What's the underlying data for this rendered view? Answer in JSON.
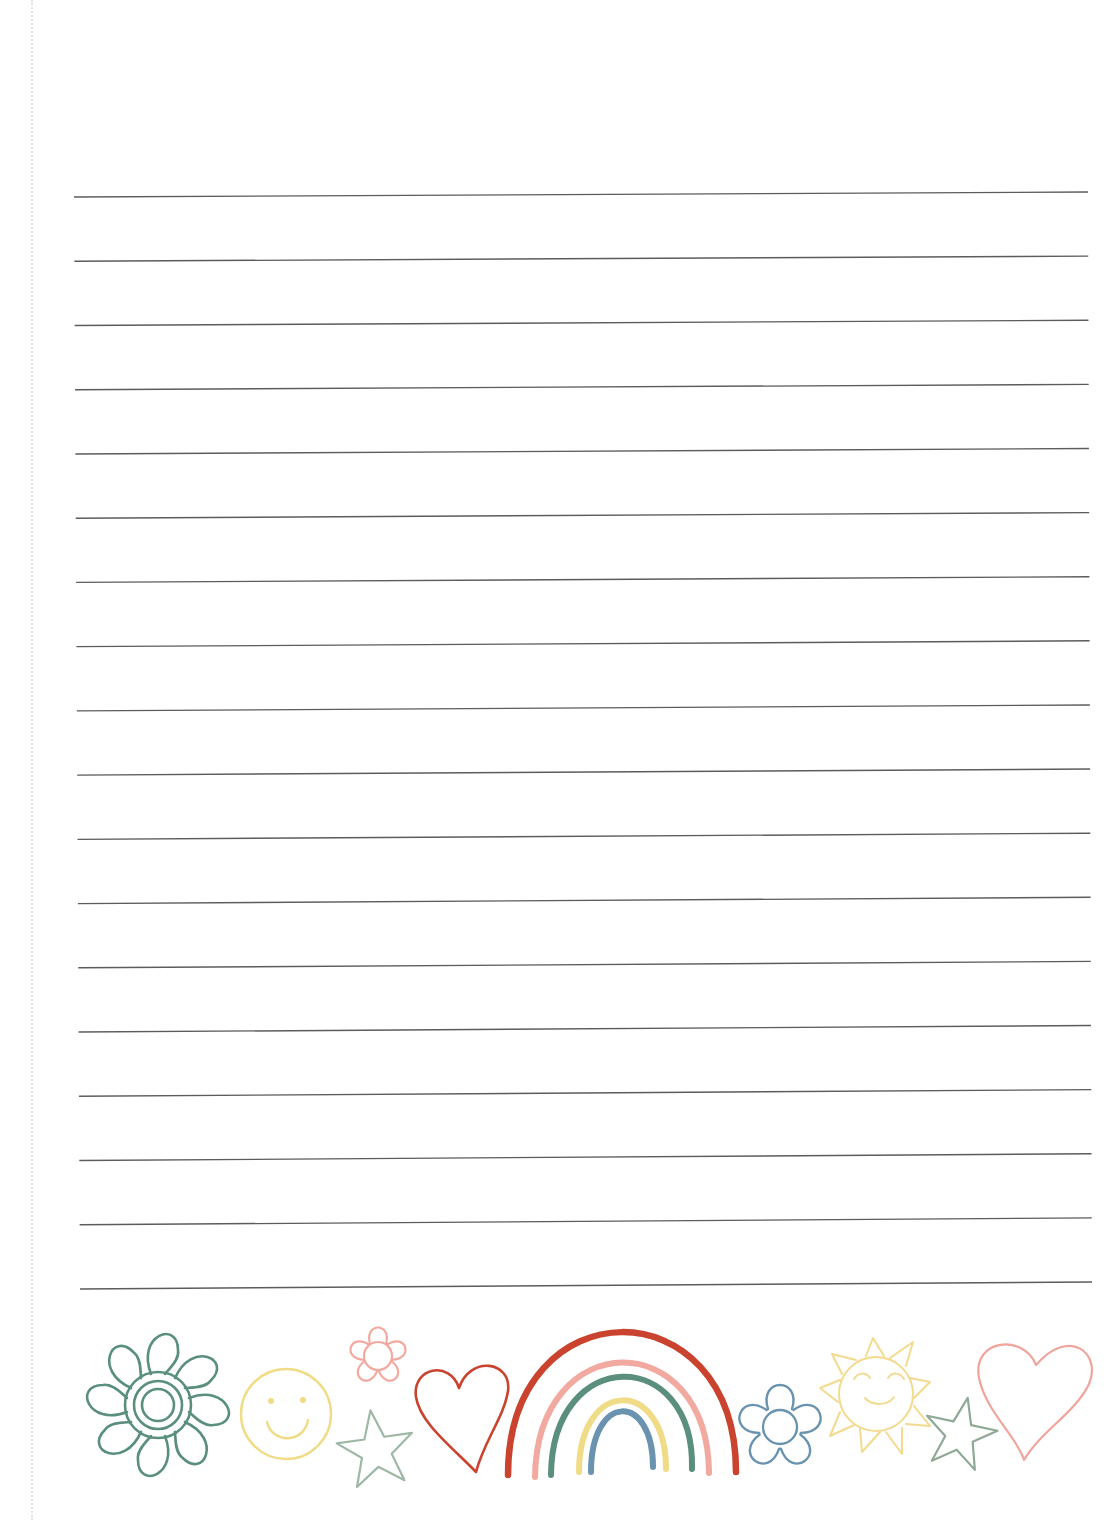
{
  "page": {
    "type": "lined-writing-paper",
    "line_count": 18,
    "line_color": "#5c5c5c",
    "first_line": {
      "x1": 74,
      "y1": 197,
      "x2": 1088,
      "y2": 192
    },
    "last_line": {
      "x1": 80,
      "y1": 1289,
      "x2": 1092,
      "y2": 1282
    }
  },
  "decorations": [
    {
      "icon": "flower-icon",
      "color": "#5a8f7e"
    },
    {
      "icon": "smiley-face-icon",
      "color": "#f0dc86"
    },
    {
      "icon": "small-flower-icon",
      "color": "#f2a9a0"
    },
    {
      "icon": "star-icon",
      "color": "#9fb8a6"
    },
    {
      "icon": "heart-icon",
      "color": "#c9432e"
    },
    {
      "icon": "rainbow-icon",
      "colors": [
        "#c9432e",
        "#f2a9a0",
        "#5a8f7e",
        "#f0dc86",
        "#6a93b0"
      ]
    },
    {
      "icon": "blue-flower-icon",
      "color": "#6a93b0"
    },
    {
      "icon": "sun-icon",
      "color": "#f3da8e"
    },
    {
      "icon": "star-icon",
      "color": "#8fa996"
    },
    {
      "icon": "heart-icon",
      "color": "#f0a49c"
    }
  ]
}
